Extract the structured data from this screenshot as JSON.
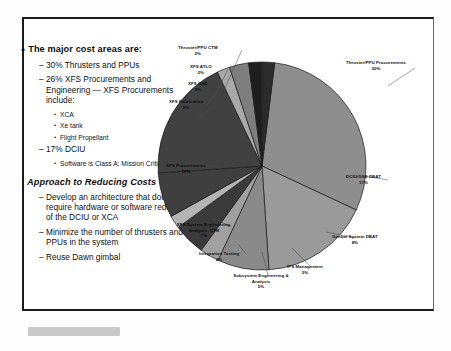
{
  "slide": {
    "bullets": {
      "heading": "The major cost areas are:",
      "items": [
        {
          "text": "30% Thrusters and PPUs",
          "sub": []
        },
        {
          "text": "26% XFS Procurements and Engineering — XFS Procurements include:",
          "sub": [
            "XCA",
            "Xe tank",
            "Flight Propellant"
          ]
        },
        {
          "text": "17% DCIU",
          "sub": [
            "Software is Class A: Mission Critical"
          ]
        }
      ]
    },
    "section": {
      "title": "Approach to Reducing Costs",
      "items": [
        {
          "text": "Develop an architecture that doesn't require hardware or software redesign of the DCIU or XCA"
        },
        {
          "text": "Minimize the number of thrusters and PPUs in the system"
        },
        {
          "text": "Reuse Dawn gimbal"
        }
      ]
    },
    "markers": {
      "diamond": "♦",
      "dash": "–",
      "dot": "•"
    }
  },
  "chart_data": {
    "type": "pie",
    "title": "",
    "legend": "none",
    "labels_show_percent": true,
    "categories": [
      "Thruster/PPU Procurements",
      "DCIU/GSE DBAT",
      "Gimbal System DBAT",
      "IPS Management",
      "Subsystem Engineering & Analysis",
      "Integration Testing",
      "XFS System Engineering, Analysis, CTM",
      "XFS Procurements",
      "XFS Fabrication",
      "XFS GSE",
      "XFS ATLO",
      "Thruster/PPU CTM"
    ],
    "values": [
      30,
      17,
      8,
      3,
      5,
      2,
      7,
      19,
      2,
      3,
      2,
      2
    ],
    "value_labels": [
      "30%",
      "17%",
      "8%",
      "3%",
      "5%",
      "2%",
      "7%",
      "19%",
      "2%",
      "3%",
      "2%",
      "2%"
    ],
    "colors": [
      "#8e8e8e",
      "#9a9a9a",
      "#8a8a8a",
      "#a0a0a0",
      "#3a3a3a",
      "#b4b4b4",
      "#3f3f3f",
      "#414141",
      "#a8a8a8",
      "#7e7e7e",
      "#1e1e1e",
      "#2b2b2b"
    ]
  }
}
